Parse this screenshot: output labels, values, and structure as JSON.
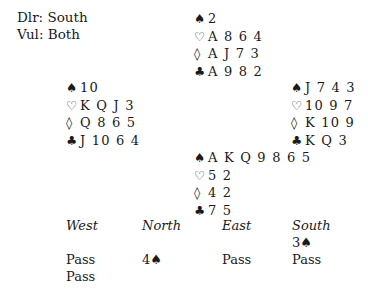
{
  "info": {
    "dealer": "Dlr: South",
    "vulnerability": "Vul: Both"
  },
  "suits": {
    "spades": "♠",
    "hearts": "♡",
    "diamonds": "◊",
    "clubs": "♣"
  },
  "hands": {
    "north": {
      "spades": "2",
      "hearts": "A 8 6 4",
      "diamonds": "A J 7 3",
      "clubs": "A 9 8 2"
    },
    "west": {
      "spades": "10",
      "hearts": "K Q J 3",
      "diamonds": "Q 8 6 5",
      "clubs": "J 10 6 4"
    },
    "east": {
      "spades": "J 7 4 3",
      "hearts": "10 9 7",
      "diamonds": "K 10 9",
      "clubs": "K Q 3"
    },
    "south": {
      "spades": "A K Q 9 8 6 5",
      "hearts": "5 2",
      "diamonds": "4 2",
      "clubs": "7 5"
    }
  },
  "auction": {
    "headers": [
      "West",
      "North",
      "East",
      "South"
    ],
    "rows": [
      [
        "",
        "",
        "",
        "3♠"
      ],
      [
        "Pass",
        "4♠",
        "Pass",
        "Pass"
      ],
      [
        "Pass",
        "",
        "",
        ""
      ]
    ]
  }
}
